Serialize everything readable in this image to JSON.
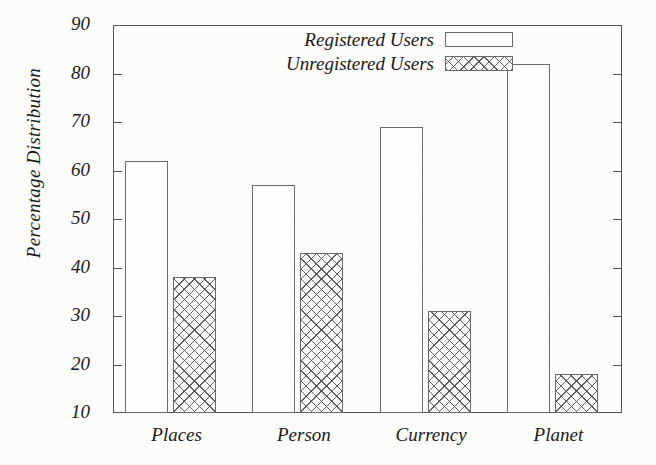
{
  "chart_data": {
    "type": "bar",
    "title": "",
    "subtitle": "",
    "xlabel": "",
    "ylabel": "Percentage Distribution",
    "categories": [
      "Places",
      "Person",
      "Currency",
      "Planet"
    ],
    "series": [
      {
        "name": "Registered Users",
        "values": [
          62,
          57,
          69,
          82
        ],
        "fill": "empty-white",
        "color": "#ffffff"
      },
      {
        "name": "Unregistered Users",
        "values": [
          38,
          43,
          31,
          18
        ],
        "fill": "cross-hatch",
        "color": "#464646"
      }
    ],
    "ylim": [
      10,
      90
    ],
    "y_ticks": [
      10,
      20,
      30,
      40,
      50,
      60,
      70,
      80,
      90
    ],
    "y_tick_labels": [
      "10",
      "20",
      "30",
      "40",
      "50",
      "60",
      "70",
      "80",
      "90"
    ],
    "grid": false,
    "legend_position": "top-center",
    "axis_color": "#555555",
    "background_color": "#fdfdfc"
  },
  "legend": {
    "entries": [
      {
        "label": "Registered Users",
        "swatch": "empty-rectangle-swatch"
      },
      {
        "label": "Unregistered Users",
        "swatch": "cross-hatch-swatch"
      }
    ]
  }
}
